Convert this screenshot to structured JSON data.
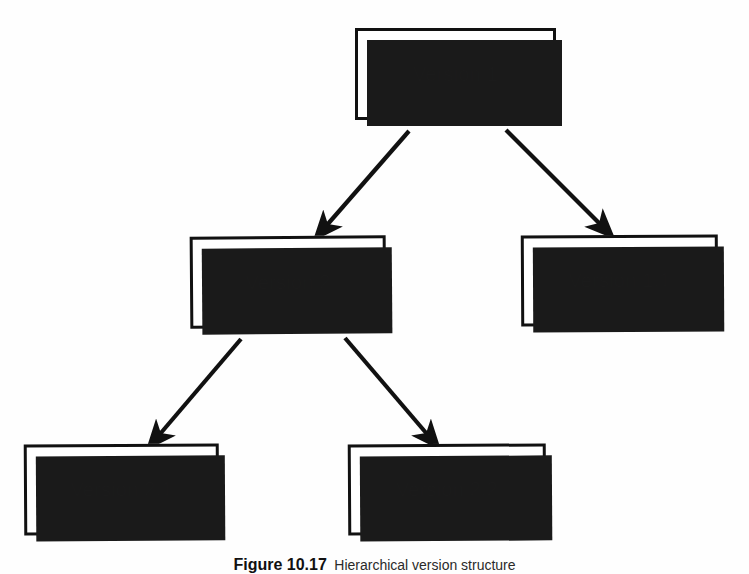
{
  "figure": {
    "caption_number": "Figure 10.17",
    "caption_text": "Hierarchical version structure",
    "diagram_type": "tree",
    "colors": {
      "box_fill": "#ffffff",
      "box_border": "#111111",
      "shadow": "#1a1a1a",
      "arrow": "#111111",
      "text": "#1b1b1b",
      "background": "#fefefe"
    }
  },
  "nodes": [
    {
      "id": "v1",
      "label": "Version 1"
    },
    {
      "id": "v2",
      "label": "Version 2"
    },
    {
      "id": "v11",
      "label": "Version 1.1"
    },
    {
      "id": "v21",
      "label": "Version 2.1"
    },
    {
      "id": "v22",
      "label": "Version 2.2"
    }
  ],
  "edges": [
    {
      "from": "v1",
      "to": "v2",
      "name": "edge-v1-to-v2"
    },
    {
      "from": "v1",
      "to": "v11",
      "name": "edge-v1-to-v11"
    },
    {
      "from": "v2",
      "to": "v21",
      "name": "edge-v2-to-v21"
    },
    {
      "from": "v2",
      "to": "v22",
      "name": "edge-v2-to-v22"
    }
  ]
}
